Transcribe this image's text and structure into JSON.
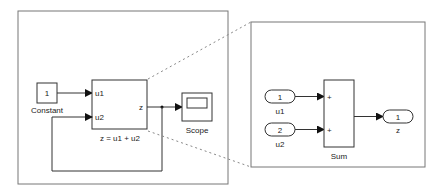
{
  "left_model": {
    "constant": {
      "value": "1",
      "label": "Constant"
    },
    "subsystem": {
      "inputs": [
        "u1",
        "u2"
      ],
      "output": "z",
      "label": "z = u1 + u2"
    },
    "scope": {
      "label": "Scope"
    }
  },
  "right_model": {
    "inports": [
      {
        "number": "1",
        "label": "u1"
      },
      {
        "number": "2",
        "label": "u2"
      }
    ],
    "sum": {
      "signs": [
        "+",
        "+"
      ],
      "label": "Sum"
    },
    "outport": {
      "number": "1",
      "label": "z"
    }
  },
  "colors": {
    "line": "#333333",
    "border": "#777777",
    "dash": "#888888"
  }
}
